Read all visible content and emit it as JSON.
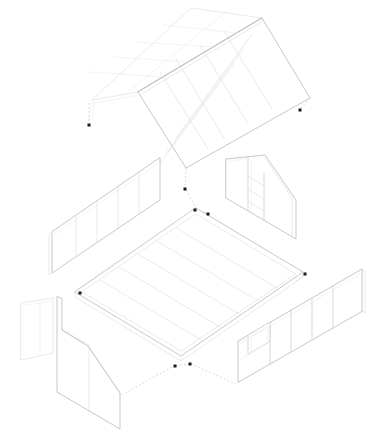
{
  "document": {
    "title": "Exploded Axonometric Assembly Drawing",
    "drawing_type": "axonometric-exploded-assembly",
    "subject": "pitched-roof cabin / small house shell",
    "background_color": "#ffffff",
    "line_color_primary": "#b9b9bd",
    "line_color_secondary": "#dcdce0",
    "guide_line_color": "#b5b5b9",
    "marker_color": "#1a1a1a",
    "canvas": {
      "width": 386,
      "height": 431
    }
  },
  "components": [
    {
      "id": "roof",
      "name": "Gable roof assembly",
      "position": "top",
      "panel_count": 12,
      "slopes": [
        "left-slope",
        "right-slope"
      ],
      "ridge": "ridge-line",
      "notes": "two pitched planes meeting at a ridge, divided into rafter bays"
    },
    {
      "id": "wall-back-left",
      "name": "Rear left long wall",
      "position": "middle-left",
      "panel_count": 5,
      "openings": 0
    },
    {
      "id": "wall-back-right",
      "name": "Rear right gable wall",
      "position": "middle-right",
      "panel_count": 3,
      "openings": 1,
      "opening_type": "stair-or-shelf-detail"
    },
    {
      "id": "floor",
      "name": "Floor deck",
      "position": "center",
      "joist_count": 6,
      "notes": "planked deck with perimeter band and visible slab thickness"
    },
    {
      "id": "wall-front-left",
      "name": "Front left gable wall with return panel",
      "position": "bottom-left",
      "panel_count": 2,
      "openings": 0
    },
    {
      "id": "wall-front-right",
      "name": "Front right long wall",
      "position": "bottom-right",
      "panel_count": 4,
      "openings": 1,
      "opening_type": "window"
    }
  ],
  "markers": {
    "label": "Assembly alignment markers",
    "shape": "square",
    "size_px": 3,
    "count": 8,
    "points": [
      {
        "id": "m1",
        "x": 89,
        "y": 125,
        "component": "roof-left-eave"
      },
      {
        "id": "m2",
        "x": 300,
        "y": 110,
        "component": "roof-right-eave"
      },
      {
        "id": "m3",
        "x": 185,
        "y": 189,
        "component": "ridge-drop"
      },
      {
        "id": "m4",
        "x": 195,
        "y": 210,
        "component": "floor-back-corner"
      },
      {
        "id": "m5",
        "x": 208,
        "y": 214,
        "component": "wall-back-right-base"
      },
      {
        "id": "m6",
        "x": 305,
        "y": 274,
        "component": "wall-front-right-top"
      },
      {
        "id": "m7",
        "x": 80,
        "y": 293,
        "component": "wall-back-left-base"
      },
      {
        "id": "m8",
        "x": 175,
        "y": 366,
        "component": "floor-front-corner"
      },
      {
        "id": "m9",
        "x": 190,
        "y": 364,
        "component": "wall-front-left-top"
      }
    ]
  },
  "guides": {
    "label": "Explosion guide lines",
    "style": "dashed",
    "dash_pattern": "1.6 2.4",
    "count": 9
  },
  "chart_data": {
    "type": "diagram",
    "projection": "isometric / axonometric",
    "part_count": 6,
    "parts": [
      {
        "name": "Gable roof assembly",
        "bays": 12
      },
      {
        "name": "Rear left long wall",
        "panels": 5
      },
      {
        "name": "Rear right gable wall",
        "panels": 3
      },
      {
        "name": "Floor deck",
        "joists": 6
      },
      {
        "name": "Front left gable wall",
        "panels": 2
      },
      {
        "name": "Front right long wall",
        "panels": 4
      }
    ]
  }
}
